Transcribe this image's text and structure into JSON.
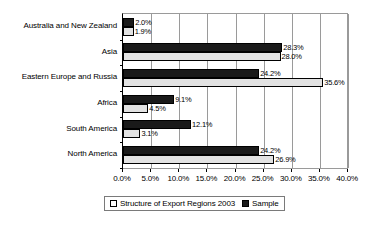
{
  "chart_data": {
    "type": "bar",
    "orientation": "horizontal",
    "title": "",
    "xlabel": "",
    "ylabel": "",
    "xlim": [
      0,
      40
    ],
    "xticks": [
      "0.0%",
      "5.0%",
      "10.0%",
      "15.0%",
      "20.0%",
      "25.0%",
      "30.0%",
      "35.0%",
      "40.0%"
    ],
    "xtick_values": [
      0,
      5,
      10,
      15,
      20,
      25,
      30,
      35,
      40
    ],
    "grid": true,
    "legend_position": "bottom",
    "categories": [
      "Australia and New Zealand",
      "Asia",
      "Eastern Europe and Russia",
      "Africa",
      "South America",
      "North America"
    ],
    "series": [
      {
        "name": "Sample",
        "color": "#1a1a1a",
        "values": [
          2.0,
          28.3,
          24.2,
          9.1,
          12.1,
          24.2
        ],
        "labels": [
          "2.0%",
          "28.3%",
          "24.2%",
          "9.1%",
          "12.1%",
          "24.2%"
        ]
      },
      {
        "name": "Structure of Export Regions 2003",
        "color": "#e2e2e2",
        "values": [
          1.9,
          28.0,
          35.6,
          4.5,
          3.1,
          26.9
        ],
        "labels": [
          "1.9%",
          "28.0%",
          "35.6%",
          "4.5%",
          "3.1%",
          "26.9%"
        ]
      }
    ],
    "legend": [
      {
        "label": "Structure of Export Regions 2003",
        "swatch": "structure"
      },
      {
        "label": "Sample",
        "swatch": "sample"
      }
    ]
  }
}
